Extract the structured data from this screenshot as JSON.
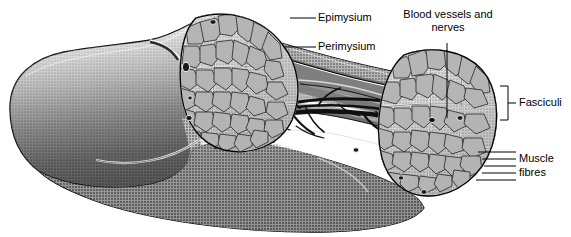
{
  "figure": {
    "background_color": "#ffffff",
    "ink_color": "#000000",
    "width": 571,
    "height": 237
  },
  "labels": {
    "epimysium": "Epimysium",
    "perimysium": "Perimysium",
    "blood_vessels_line1": "Blood vessels and",
    "blood_vessels_line2": "nerves",
    "fasciculi": "Fasciculi",
    "muscle_fibres_line1": "Muscle",
    "muscle_fibres_line2": "fibres"
  },
  "colors": {
    "outline": "#000000",
    "belly_light": "#f2f2f2",
    "belly_mid": "#9a9a9a",
    "belly_dark": "#2b2b2b",
    "belly_shadow": "#171717",
    "cut_surface": "#b9b9b9",
    "cut_surface_dark": "#8f8f8f",
    "fascicle_fill": "#a8a8a8",
    "fascicle_fill_light": "#c4c4c4",
    "vessel": "#1a1a1a",
    "connective_highlight": "#ffffff"
  },
  "parts": {
    "muscle_belly": "muscle-belly",
    "cut_face_left": "proximal-cut-face",
    "cut_face_right": "distal-cut-face",
    "epimysium_sheath": "epimysium-sheath",
    "perimysium_septa": "perimysium-septa",
    "fascicles": "fascicle-bundles",
    "vessels": "blood-vessel-network",
    "fibre_striations": "muscle-fibre-striations"
  }
}
